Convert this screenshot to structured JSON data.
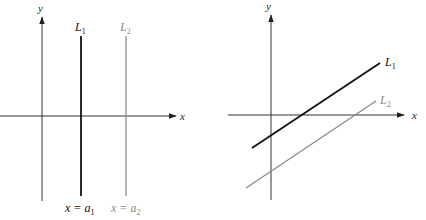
{
  "colors": {
    "axis": "#222222",
    "line1": "#111111",
    "line2": "#8a8a8a",
    "background": "#ffffff"
  },
  "left_panel": {
    "y_axis_label": "y",
    "x_axis_label": "x",
    "line1": {
      "name": "L",
      "subscript": "1",
      "equation_lhs": "x = a",
      "equation_sub": "1"
    },
    "line2": {
      "name": "L",
      "subscript": "2",
      "equation_lhs": "x = a",
      "equation_sub": "2"
    }
  },
  "right_panel": {
    "y_axis_label": "y",
    "x_axis_label": "x",
    "line1": {
      "name": "L",
      "subscript": "1"
    },
    "line2": {
      "name": "L",
      "subscript": "2"
    }
  }
}
